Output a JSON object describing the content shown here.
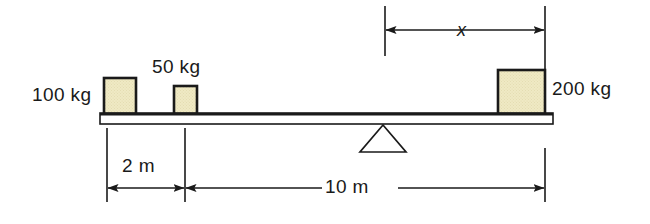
{
  "figure": {
    "type": "lever-balance-diagram"
  },
  "colors": {
    "block_fill": "#efe9c4",
    "block_stroke": "#1a1a1a",
    "beam_fill": "#ffffff",
    "beam_stroke": "#1a1a1a",
    "line": "#1a1a1a",
    "background": "#ffffff",
    "text": "#1a1a1a"
  },
  "masses": [
    {
      "id": "mass-100kg",
      "label": "100 kg",
      "value": 100,
      "unit": "kg",
      "label_side": "left"
    },
    {
      "id": "mass-50kg",
      "label": "50 kg",
      "value": 50,
      "unit": "kg",
      "label_side": "above"
    },
    {
      "id": "mass-200kg",
      "label": "200 kg",
      "value": 200,
      "unit": "kg",
      "label_side": "right"
    }
  ],
  "dimensions": [
    {
      "id": "dim-x",
      "label": "x",
      "value": null,
      "unit": "m",
      "position": "top",
      "note": "unknown distance from fulcrum to 200 kg mass"
    },
    {
      "id": "dim-2m",
      "label": "2 m",
      "value": 2,
      "unit": "m",
      "position": "bottom",
      "note": "distance from beam left end to 50 kg mass"
    },
    {
      "id": "dim-10m",
      "label": "10 m",
      "value": 10,
      "unit": "m",
      "position": "bottom",
      "note": "distance from 50 kg mass to beam right end"
    }
  ],
  "fulcrum": {
    "id": "fulcrum",
    "shape": "triangle",
    "label": ""
  },
  "beam": {
    "id": "beam",
    "label": ""
  }
}
